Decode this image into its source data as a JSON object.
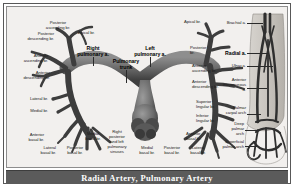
{
  "figure": {
    "caption": "Radial Artery, Pulmonary Artery",
    "colors": {
      "plate_background": "#f2f0ee",
      "caption_bar": "#5b5b5b",
      "caption_text": "#ffffff",
      "vessel_dark": "#3a3a3a",
      "vessel_mid": "#6a6a6a",
      "vessel_light": "#9a9a9a",
      "frame_border": "#585858",
      "label_text": "#1c1c1c"
    }
  },
  "pulmonary": {
    "major_labels": [
      {
        "id": "right-pulmonary-artery",
        "text": "Right\npulmonary a."
      },
      {
        "id": "pulmonary-trunk",
        "text": "Pulmonary\ntrunk"
      },
      {
        "id": "left-pulmonary-artery",
        "text": "Left\npulmonary a."
      }
    ],
    "left_lung_labels": [
      {
        "id": "posterior-ascending-br",
        "text": "Posterior\nascending br."
      },
      {
        "id": "posterior-descending-br",
        "text": "Posterior\ndescending br."
      },
      {
        "id": "anterior-ascending-br",
        "text": "Anterior\nascending br."
      },
      {
        "id": "anterior-descending-br",
        "text": "Anterior\ndescending br."
      },
      {
        "id": "lateral-br",
        "text": "Lateral br."
      },
      {
        "id": "medial-br",
        "text": "Medial br."
      },
      {
        "id": "anterior-basal-br-left",
        "text": "Anterior\nbasal br."
      },
      {
        "id": "lateral-basal-br-left",
        "text": "Lateral\nbasal br."
      },
      {
        "id": "posterior-basal-br-left",
        "text": "Posterior\nbasal br."
      },
      {
        "id": "medial-basal-br-left",
        "text": "Medial\nbasal br."
      }
    ],
    "center_labels": [
      {
        "id": "apical-br-right",
        "text": "Apical br."
      },
      {
        "id": "pulmonary-sinuses",
        "text": "Right\nposterior\nand left\npulmonary\nsinuses"
      }
    ],
    "right_lung_labels": [
      {
        "id": "apical-br-left",
        "text": "Apical br."
      },
      {
        "id": "posterior-br",
        "text": "Posterior\nbr."
      },
      {
        "id": "anterior-ascending-br-right",
        "text": "Anterior\nascending br."
      },
      {
        "id": "anterior-descending-br-right",
        "text": "Anterior\ndescending br."
      },
      {
        "id": "superior-lingular-br",
        "text": "Superior\nlingular br."
      },
      {
        "id": "inferior-lingular-br",
        "text": "Inferior\nlingular br."
      },
      {
        "id": "anterior-basal-br-right",
        "text": "Anterior\nbasal br."
      },
      {
        "id": "medial-basal-br-right",
        "text": "Medial\nbasal br."
      },
      {
        "id": "posterior-basal-br-right",
        "text": "Posterior\nbasal br."
      },
      {
        "id": "lateral-basal-br-right",
        "text": "Lateral\nbasal br."
      }
    ]
  },
  "arm": {
    "labels": [
      {
        "id": "brachial-artery",
        "text": "Brachial a."
      },
      {
        "id": "radial-artery",
        "text": "Radial a."
      },
      {
        "id": "ulnar-artery",
        "text": "Ulnar a."
      },
      {
        "id": "anterior-interosseous-artery",
        "text": "Anterior\ninterosseous\na."
      },
      {
        "id": "palmar-carpal-arch",
        "text": "Palmar\ncarpal arch"
      },
      {
        "id": "deep-palmar-arch",
        "text": "Deep\npalmar\narch"
      },
      {
        "id": "superficial-palmar-arch",
        "text": "Superficial\npalmar arch"
      }
    ]
  }
}
